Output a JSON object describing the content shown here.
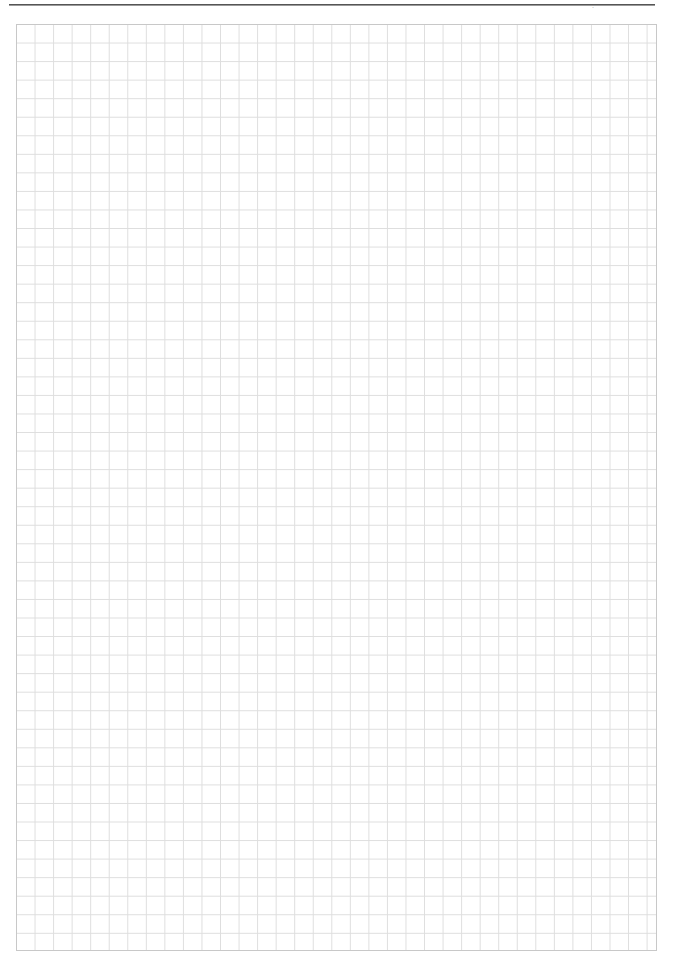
{
  "page": {
    "type": "graph-paper-sheet",
    "header": {
      "page_number": "·"
    },
    "grid": {
      "columns": 35,
      "rows": 50,
      "line_color": "#dedede",
      "border_color": "#c8c8c8",
      "background_color": "#ffffff"
    }
  }
}
